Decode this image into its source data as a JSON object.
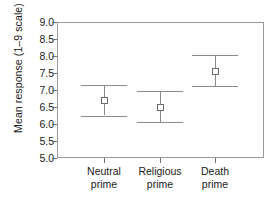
{
  "chart_data": {
    "type": "scatter",
    "title": "",
    "subtitle": "",
    "xlabel": "",
    "ylabel": "Mean response (1–9 scale)",
    "categories": [
      "Neutral prime",
      "Religious prime",
      "Death prime"
    ],
    "category_lines": [
      [
        "Neutral",
        "prime"
      ],
      [
        "Religious",
        "prime"
      ],
      [
        "Death",
        "prime"
      ]
    ],
    "values": [
      6.7,
      6.5,
      7.57
    ],
    "error_upper": [
      7.15,
      6.96,
      8.03
    ],
    "error_lower": [
      6.25,
      6.05,
      7.13
    ],
    "ylim": [
      5.0,
      9.0
    ],
    "ytick_labels": [
      "9.0",
      "8.5",
      "8.0",
      "7.5",
      "7.0",
      "6.5",
      "6.0",
      "5.5",
      "5.0"
    ],
    "ytick_values": [
      9.0,
      8.5,
      8.0,
      7.5,
      7.0,
      6.5,
      6.0,
      5.5,
      5.0
    ],
    "grid": false,
    "legend": false,
    "legend_position": "none",
    "marker": "open-square",
    "series": [
      {
        "name": "Mean response",
        "values": [
          6.7,
          6.5,
          7.57
        ],
        "error_upper": [
          7.15,
          6.96,
          8.03
        ],
        "error_lower": [
          6.25,
          6.05,
          7.13
        ]
      }
    ],
    "colors": {
      "frame": "#9a9a9a",
      "errorbar": "#8a8a8a",
      "marker_edge": "#6a6a6a",
      "marker_fill": "#ffffff",
      "text": "#1a1a1a"
    }
  }
}
